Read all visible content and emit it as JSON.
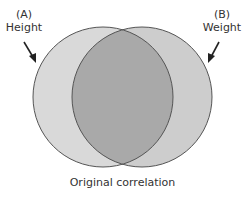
{
  "diagram": {
    "type": "venn",
    "caption": "Original correlation",
    "sets": [
      {
        "id": "A",
        "tag": "(A)",
        "name": "Height",
        "fill": "#d9d9d9"
      },
      {
        "id": "B",
        "tag": "(B)",
        "name": "Weight",
        "fill": "#cdcdcd"
      }
    ],
    "overlap": {
      "fill": "#a9a9a9"
    },
    "stroke": "#555555"
  }
}
